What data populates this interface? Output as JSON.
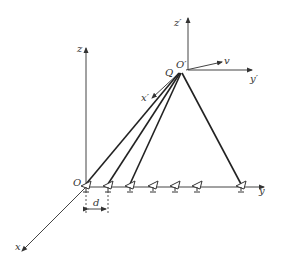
{
  "diagram": {
    "type": "antenna array tracking geometry",
    "labels": {
      "z": "z",
      "z_prime": "z′",
      "x": "x",
      "x_prime": "x′",
      "y": "y",
      "y_prime": "y′",
      "origin": "O",
      "origin_prime": "O′",
      "target": "Q",
      "velocity": "v",
      "spacing": "d"
    },
    "antenna_count": 7,
    "antenna_positions_x": [
      86,
      108,
      130,
      153,
      175,
      197,
      241
    ],
    "beams_to_target_from_antennas": [
      0,
      1,
      2,
      6
    ],
    "colors": {
      "line": "#222222",
      "axis": "#444444",
      "text": "#333333"
    }
  }
}
